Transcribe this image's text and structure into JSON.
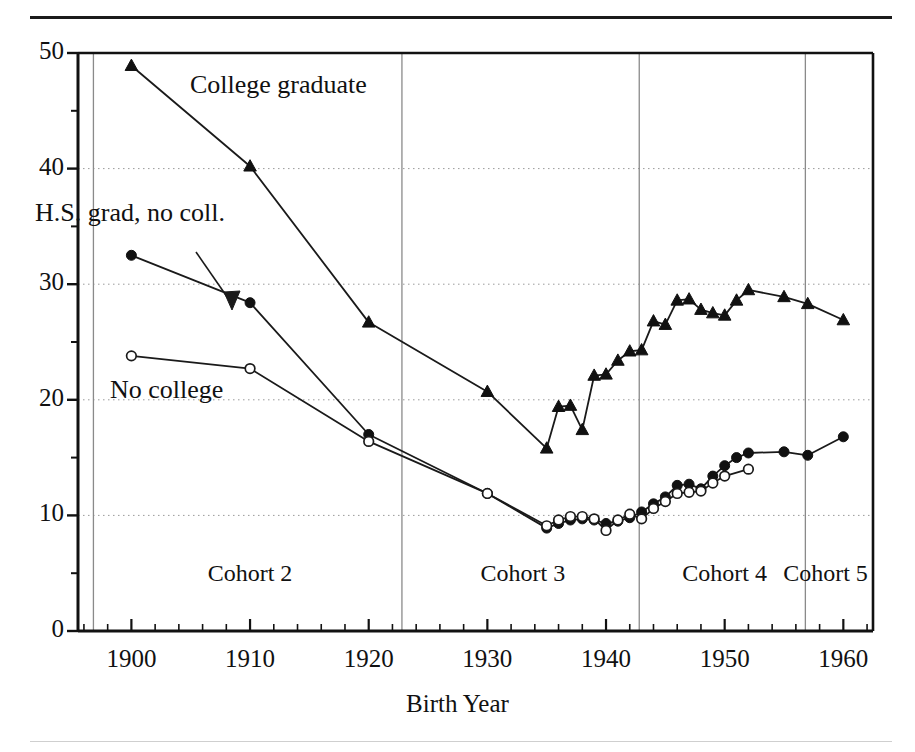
{
  "figure": {
    "top_rule": "",
    "bottom_rule": ""
  },
  "axes": {
    "x_title": "Birth Year",
    "y_title": "",
    "x_ticks": [
      "1900",
      "1910",
      "1920",
      "1930",
      "1940",
      "1950",
      "1960"
    ],
    "y_ticks": [
      "0",
      "10",
      "20",
      "30",
      "40",
      "50"
    ]
  },
  "annotations": {
    "college": "College graduate",
    "hsgrad": "H.S. grad, no coll.",
    "nocollege": "No college"
  },
  "cohorts": [
    {
      "label": "Cohort 2",
      "center_year": 1910
    },
    {
      "label": "Cohort 3",
      "center_year": 1933
    },
    {
      "label": "Cohort 4",
      "center_year": 1950
    },
    {
      "label": "Cohort 5",
      "center_year": 1958.5
    }
  ],
  "cohort_dividers": [
    1896.8,
    1922.8,
    1942.8,
    1956.8
  ],
  "colors": {
    "axis": "#111111",
    "line": "#1a1a1a",
    "grid": "#9a9a9a",
    "divider": "#8a8a8a",
    "marker_fill": "#111111",
    "marker_open": "#ffffff"
  },
  "chart_data": {
    "type": "line",
    "title": "",
    "xlabel": "Birth Year",
    "ylabel": "",
    "xlim": [
      1895.5,
      1962.5
    ],
    "ylim": [
      0,
      50
    ],
    "grid": "horizontal dotted at 10,20,30,40",
    "legend": "inline annotations with arrow for H.S. grad, no coll.",
    "x_major_ticks": [
      1900,
      1910,
      1920,
      1930,
      1940,
      1950,
      1960
    ],
    "x_minor_tick_step": 2,
    "y_major_ticks": [
      0,
      10,
      20,
      30,
      40,
      50
    ],
    "y_minor_ticks": [
      5,
      15,
      25,
      35,
      45
    ],
    "series": [
      {
        "name": "College graduate",
        "marker": "filled-triangle",
        "points": [
          [
            1900,
            48.9
          ],
          [
            1910,
            40.2
          ],
          [
            1920,
            26.7
          ],
          [
            1930,
            20.7
          ],
          [
            1935,
            15.8
          ],
          [
            1936,
            19.4
          ],
          [
            1937,
            19.5
          ],
          [
            1938,
            17.4
          ],
          [
            1939,
            22.1
          ],
          [
            1940,
            22.2
          ],
          [
            1941,
            23.4
          ],
          [
            1942,
            24.2
          ],
          [
            1943,
            24.3
          ],
          [
            1944,
            26.8
          ],
          [
            1945,
            26.5
          ],
          [
            1946,
            28.6
          ],
          [
            1947,
            28.7
          ],
          [
            1948,
            27.8
          ],
          [
            1949,
            27.5
          ],
          [
            1950,
            27.3
          ],
          [
            1951,
            28.6
          ],
          [
            1952,
            29.5
          ],
          [
            1955,
            28.9
          ],
          [
            1957,
            28.3
          ],
          [
            1960,
            26.9
          ]
        ]
      },
      {
        "name": "H.S. grad, no coll.",
        "marker": "filled-circle",
        "points": [
          [
            1900,
            32.5
          ],
          [
            1910,
            28.4
          ],
          [
            1920,
            17.0
          ],
          [
            1930,
            11.9
          ],
          [
            1935,
            8.9
          ],
          [
            1936,
            9.3
          ],
          [
            1937,
            9.6
          ],
          [
            1938,
            9.7
          ],
          [
            1939,
            9.6
          ],
          [
            1940,
            9.3
          ],
          [
            1941,
            9.5
          ],
          [
            1942,
            9.8
          ],
          [
            1943,
            10.3
          ],
          [
            1944,
            11.0
          ],
          [
            1945,
            11.6
          ],
          [
            1946,
            12.6
          ],
          [
            1947,
            12.7
          ],
          [
            1948,
            12.3
          ],
          [
            1949,
            13.4
          ],
          [
            1950,
            14.3
          ],
          [
            1951,
            15.0
          ],
          [
            1952,
            15.4
          ],
          [
            1955,
            15.5
          ],
          [
            1957,
            15.2
          ],
          [
            1960,
            16.8
          ]
        ]
      },
      {
        "name": "No college",
        "marker": "open-circle",
        "points": [
          [
            1900,
            23.8
          ],
          [
            1910,
            22.7
          ],
          [
            1920,
            16.4
          ],
          [
            1930,
            11.9
          ],
          [
            1935,
            9.1
          ],
          [
            1936,
            9.6
          ],
          [
            1937,
            9.9
          ],
          [
            1938,
            9.9
          ],
          [
            1939,
            9.7
          ],
          [
            1940,
            8.7
          ],
          [
            1941,
            9.6
          ],
          [
            1942,
            10.1
          ],
          [
            1943,
            9.7
          ],
          [
            1944,
            10.6
          ],
          [
            1945,
            11.2
          ],
          [
            1946,
            11.9
          ],
          [
            1947,
            12.0
          ],
          [
            1948,
            12.1
          ],
          [
            1949,
            12.8
          ],
          [
            1950,
            13.4
          ],
          [
            1952,
            14.0
          ]
        ]
      }
    ]
  }
}
